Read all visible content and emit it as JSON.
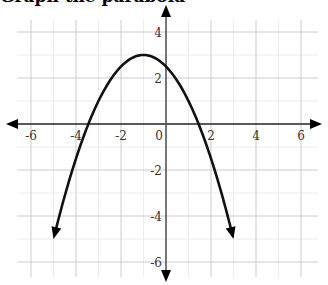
{
  "header": {
    "cropped_text": "Graph the parabola"
  },
  "chart_data": {
    "type": "line",
    "title": "",
    "xlabel": "",
    "ylabel": "",
    "xlim": [
      -6.5,
      6.5
    ],
    "ylim": [
      -6.5,
      5
    ],
    "grid": true,
    "x_ticks": [
      -6,
      -4,
      -2,
      0,
      2,
      4,
      6
    ],
    "y_ticks": [
      4,
      2,
      -2,
      -4,
      -6
    ],
    "x_tick_labels": [
      "-6",
      "-4",
      "-2",
      "0",
      "2",
      "4",
      "6"
    ],
    "y_tick_labels": [
      "4",
      "2",
      "-2",
      "-4",
      "-6"
    ],
    "series": [
      {
        "name": "parabola",
        "equation": "y = -0.5(x + 1)^2 + 3",
        "vertex": [
          -1,
          3
        ],
        "x_range": [
          -5,
          3
        ],
        "endpoints_arrows": true,
        "points": [
          [
            -5,
            -5
          ],
          [
            -4,
            -1.5
          ],
          [
            -3.45,
            0
          ],
          [
            -3,
            1
          ],
          [
            -2,
            2.5
          ],
          [
            -1,
            3
          ],
          [
            0,
            2.5
          ],
          [
            1,
            1
          ],
          [
            1.45,
            0
          ],
          [
            2,
            -1.5
          ],
          [
            3,
            -5
          ]
        ]
      }
    ],
    "colors": {
      "curve": "#111111",
      "axis": "#222222",
      "grid_major": "#cccccc",
      "grid_minor": "#ececec"
    }
  }
}
